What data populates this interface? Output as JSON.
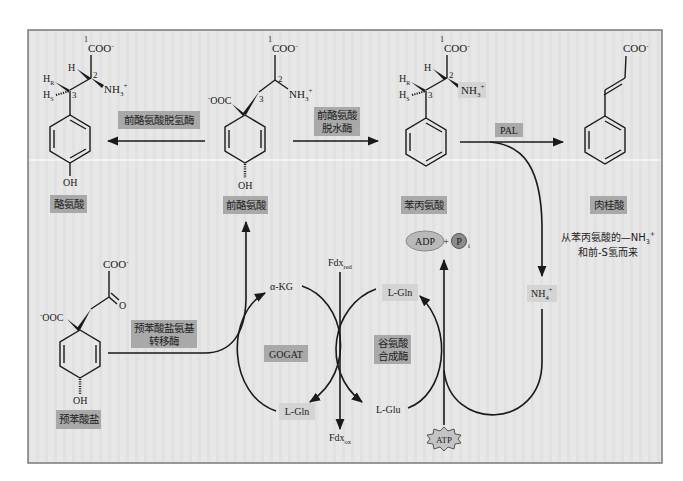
{
  "diagram": {
    "colors": {
      "frame_bg": "#e6e6e6",
      "frame_border": "#7a7a7a",
      "enzyme_box": "#a9a9a9",
      "ion_box": "#d4d4d4",
      "line": "#1a1a1a"
    },
    "compounds": {
      "tyrosine": {
        "name": "酪氨酸",
        "carboxyl": "COO",
        "carboxyl_charge": "-",
        "c1": "1",
        "c2": "2",
        "c3": "3",
        "h": "H",
        "hr": "H",
        "hr_sub": "R",
        "hs": "H",
        "hs_sub": "S",
        "amine": "NH",
        "amine_sub": "3",
        "amine_charge": "+",
        "hydroxyl": "OH"
      },
      "arogenate": {
        "name": "前酪氨酸",
        "carboxyl": "COO",
        "carboxyl_charge": "-",
        "ring_carboxyl": "OOC",
        "ring_carboxyl_charge": "-",
        "c1": "1",
        "c2": "2",
        "c3": "3",
        "amine": "NH",
        "amine_sub": "3",
        "amine_charge": "+",
        "hydroxyl": "OH"
      },
      "phenylalanine": {
        "name": "苯丙氨酸",
        "carboxyl": "COO",
        "carboxyl_charge": "-",
        "c1": "1",
        "c2": "2",
        "c3": "3",
        "h": "H",
        "hr": "H",
        "hr_sub": "R",
        "hs": "H",
        "hs_sub": "S",
        "amine": "NH",
        "amine_sub": "3",
        "amine_charge": "+"
      },
      "cinnamate": {
        "name": "肉桂酸",
        "carboxyl": "COO",
        "carboxyl_charge": "-",
        "note_line1": "从苯丙氨酸的—NH",
        "note_line1_sub": "3",
        "note_line1_charge": "+",
        "note_line2": "和前-S氢而来"
      },
      "prephenate": {
        "name": "预苯酸盐",
        "carboxyl": "COO",
        "carboxyl_charge": "-",
        "ketone_o": "O",
        "ring_carboxyl": "OOC",
        "ring_carboxyl_charge": "-",
        "hydroxyl": "OH"
      }
    },
    "enzymes": {
      "arogenate_dehydrogenase": "前酪氨酸脱氢酶",
      "arogenate_dehydratase_line1": "前酪氨酸",
      "arogenate_dehydratase_line2": "脱水酶",
      "pal": "PAL",
      "prephenate_aminotransferase_line1": "预苯酸盐氨基",
      "prephenate_aminotransferase_line2": "转移酶",
      "gogat": "GOGAT",
      "glutamine_synthetase_line1": "谷氨酸",
      "glutamine_synthetase_line2": "合成酶"
    },
    "cofactors": {
      "akg": "α-KG",
      "lgln_left": "L-Gln",
      "lgln_right": "L-Gln",
      "lglu": "L-Glu",
      "fdx_red": "Fdx",
      "fdx_red_sub": "red",
      "fdx_ox": "Fdx",
      "fdx_ox_sub": "ox",
      "nh4": "NH",
      "nh4_sub": "4",
      "nh4_charge": "+",
      "adp": "ADP",
      "plus": "+",
      "pi": "P",
      "pi_sub": "i",
      "atp": "ATP"
    }
  }
}
